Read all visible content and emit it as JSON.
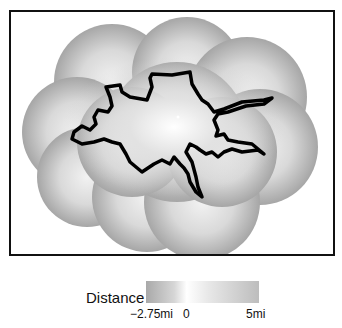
{
  "figure": {
    "type": "distance-field-map",
    "frame_border_color": "#111111",
    "field_colors": {
      "outer": "#a8a8a8",
      "inner": "#ffffff"
    },
    "path_color": "#000000"
  },
  "legend": {
    "title": "Distance",
    "ticks": [
      "−2.75mi",
      "0",
      "5mi"
    ],
    "range": {
      "min": -2.75,
      "zero": 0,
      "max": 5,
      "unit": "mi"
    }
  }
}
